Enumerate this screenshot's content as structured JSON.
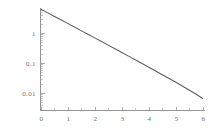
{
  "chart_data": {
    "type": "line",
    "title": "",
    "subtitle": "",
    "xlabel": "",
    "ylabel": "",
    "yscale": "log",
    "xscale": "linear",
    "grid": false,
    "legend": null,
    "xlim": [
      0,
      6
    ],
    "ylim": [
      0.004,
      6.3
    ],
    "x_ticks": [
      {
        "value": 0,
        "label": "0"
      },
      {
        "value": 1,
        "label": "1"
      },
      {
        "value": 2,
        "label": "2"
      },
      {
        "value": 3,
        "label": "3"
      },
      {
        "value": 4,
        "label": "4"
      },
      {
        "value": 5,
        "label": "5"
      },
      {
        "value": 6,
        "label": "6"
      }
    ],
    "y_ticks": [
      {
        "value": 1,
        "label": "1"
      },
      {
        "value": 0.1,
        "label": "0.1"
      },
      {
        "value": 0.01,
        "label": "0.01"
      }
    ],
    "series": [
      {
        "name": "decay",
        "color": "#5d5d5d",
        "x": [
          0,
          0.25,
          0.5,
          0.75,
          1,
          1.25,
          1.5,
          1.75,
          2,
          2.25,
          2.5,
          2.75,
          3,
          3.25,
          3.5,
          3.75,
          4,
          4.25,
          4.5,
          4.75,
          5,
          5.25,
          5.5,
          5.75,
          6
        ],
        "y": [
          6.31,
          4.79,
          3.63,
          2.75,
          2.09,
          1.58,
          1.2,
          0.908,
          0.688,
          0.521,
          0.394,
          0.298,
          0.225,
          0.17,
          0.128,
          0.0963,
          0.0724,
          0.0543,
          0.0407,
          0.0304,
          0.0227,
          0.0168,
          0.0124,
          0.00905,
          0.00646
        ]
      }
    ]
  },
  "axes": {
    "x_axis_name": "x-axis",
    "y_axis_name": "y-axis"
  }
}
